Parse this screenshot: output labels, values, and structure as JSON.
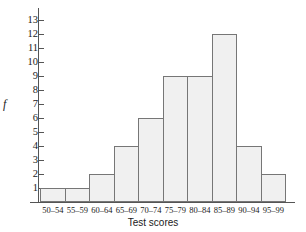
{
  "chart_data": {
    "type": "bar",
    "title": "",
    "xlabel": "Test scores",
    "ylabel": "f",
    "categories": [
      "50–54",
      "55–59",
      "60–64",
      "65–69",
      "70–74",
      "75–79",
      "80–84",
      "85–89",
      "90–94",
      "95–99"
    ],
    "values": [
      1,
      1,
      2,
      4,
      6,
      9,
      9,
      12,
      4,
      2
    ],
    "ylim": [
      0,
      13
    ],
    "ytick_labels": [
      "13",
      "12",
      "11",
      "10",
      "9",
      "8",
      "7",
      "6",
      "5",
      "4",
      "3",
      "2",
      "1"
    ],
    "ytick_values": [
      13,
      12,
      11,
      10,
      9,
      8,
      7,
      6,
      5,
      4,
      3,
      2,
      1
    ],
    "grid": false,
    "legend": null,
    "bar_fill_color": "#f0f0f0",
    "bar_border_color": "#767676",
    "axis_color": "#555555",
    "background_color": "#ffffff"
  }
}
